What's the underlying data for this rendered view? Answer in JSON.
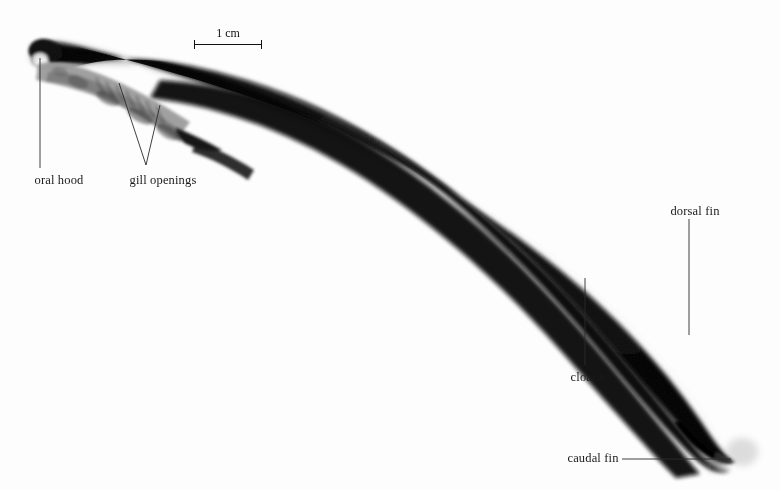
{
  "figure": {
    "background_color": "#fdfdfd",
    "ink_color": "#1a1a1a",
    "width": 780,
    "height": 490
  },
  "scale_bar": {
    "label": "1 cm",
    "length_px": 68,
    "x": 194,
    "y": 44
  },
  "annotations": [
    {
      "id": "oral-hood",
      "label": "oral hood",
      "text_x": 59,
      "text_y": 182,
      "leader": [
        [
          40,
          58
        ],
        [
          40,
          168
        ]
      ]
    },
    {
      "id": "gill-openings",
      "label": "gill openings",
      "text_x": 163,
      "text_y": 182,
      "leader": [
        [
          119,
          83
        ],
        [
          146,
          165
        ]
      ],
      "leader2": [
        [
          160,
          105
        ],
        [
          146,
          165
        ]
      ]
    },
    {
      "id": "cloaca",
      "label": "cloaca",
      "text_x": 587,
      "text_y": 379,
      "leader": [
        [
          585,
          278
        ],
        [
          585,
          365
        ]
      ]
    },
    {
      "id": "dorsal-fin",
      "label": "dorsal fin",
      "text_x": 695,
      "text_y": 213,
      "leader": [
        [
          689,
          219
        ],
        [
          689,
          335
        ]
      ]
    },
    {
      "id": "caudal-fin",
      "label": "caudal fin",
      "text_x": 593,
      "text_y": 463,
      "leader": [
        [
          622,
          459
        ],
        [
          731,
          459
        ]
      ]
    }
  ]
}
